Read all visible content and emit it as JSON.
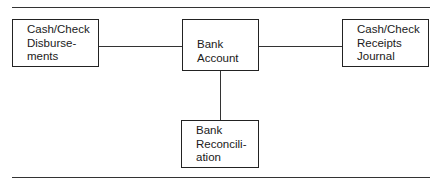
{
  "diagram": {
    "nodes": [
      {
        "id": "disbursements",
        "lines": [
          "Cash/Check",
          "Disburse-",
          "ments"
        ]
      },
      {
        "id": "bank_account",
        "lines": [
          "Bank",
          "Account"
        ]
      },
      {
        "id": "receipts",
        "lines": [
          "Cash/Check",
          "Receipts",
          "Journal"
        ]
      },
      {
        "id": "reconciliation",
        "lines": [
          "Bank",
          "Reconcili-",
          "ation"
        ]
      }
    ],
    "edges": [
      {
        "from": "disbursements",
        "to": "bank_account"
      },
      {
        "from": "bank_account",
        "to": "receipts"
      },
      {
        "from": "bank_account",
        "to": "reconciliation"
      }
    ]
  }
}
